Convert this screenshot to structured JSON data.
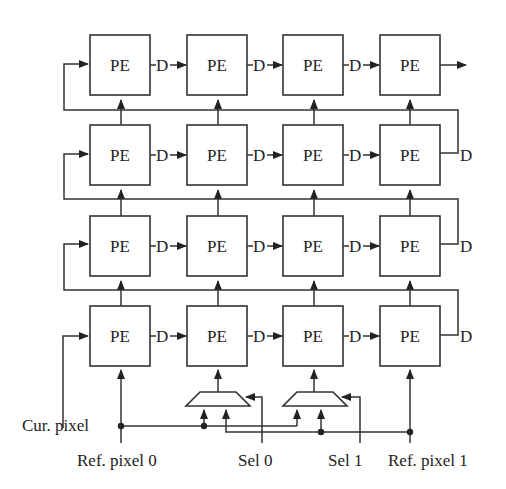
{
  "diagram": {
    "grid": {
      "rows": 4,
      "cols": 4
    },
    "pe_label": "PE",
    "delay_label": "D",
    "inputs": {
      "cur_pixel": "Cur. pixel",
      "ref_pixel_0": "Ref. pixel 0",
      "sel_0": "Sel 0",
      "sel_1": "Sel 1",
      "ref_pixel_1": "Ref. pixel 1"
    },
    "multiplexers": 2
  }
}
